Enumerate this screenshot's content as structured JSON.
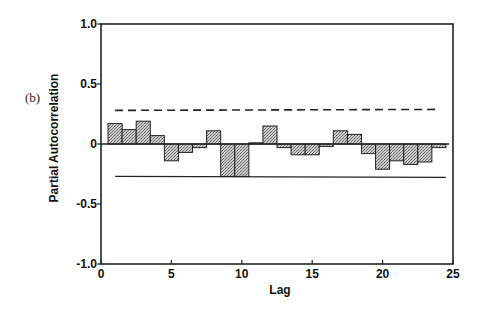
{
  "panel_label": "(b)",
  "chart_data": {
    "type": "bar",
    "title": "",
    "xlabel": "Lag",
    "ylabel": "Partial Autocorrelation",
    "xlim": [
      0,
      25
    ],
    "ylim": [
      -1.0,
      1.0
    ],
    "x_ticks": [
      0,
      5,
      10,
      15,
      20,
      25
    ],
    "x_tick_labels": [
      "0",
      "5",
      "10",
      "15",
      "20",
      "25"
    ],
    "y_ticks": [
      1.0,
      0.5,
      0,
      -0.5,
      -1.0
    ],
    "y_tick_labels": [
      "1.0",
      "0.5",
      "0",
      "-0.5",
      "-1.0"
    ],
    "grid": false,
    "legend": null,
    "categories": [
      1,
      2,
      3,
      4,
      5,
      6,
      7,
      8,
      9,
      10,
      11,
      12,
      13,
      14,
      15,
      16,
      17,
      18,
      19,
      20,
      21,
      22,
      23,
      24
    ],
    "values": [
      0.17,
      0.12,
      0.19,
      0.07,
      -0.14,
      -0.07,
      -0.03,
      0.11,
      -0.27,
      -0.27,
      0.01,
      0.15,
      -0.03,
      -0.09,
      -0.09,
      -0.02,
      0.11,
      0.08,
      -0.08,
      -0.21,
      -0.14,
      -0.17,
      -0.15,
      -0.03
    ],
    "confidence_bounds": {
      "upper": {
        "value": 0.28,
        "style": "dashed",
        "x_range": [
          1,
          24
        ]
      },
      "lower": {
        "value": -0.27,
        "style": "solid",
        "x_range": [
          1,
          24.5
        ]
      }
    },
    "bar_fill": "#b8b8b8",
    "bar_edge": "#222222"
  }
}
